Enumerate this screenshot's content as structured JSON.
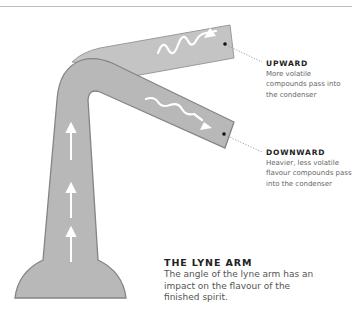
{
  "diagram": {
    "title": "THE LYNE ARM",
    "description": "The angle of the lyne arm has an impact on the flavour of the finished spirit.",
    "colors": {
      "still_fill": "#b8b8b8",
      "still_outline": "#8a8a8a",
      "arrow": "#ffffff",
      "leader_line": "#888888",
      "top_rule": "#bdbdbd"
    },
    "callouts": [
      {
        "id": "upward",
        "heading": "UPWARD",
        "text": "More volatile compounds pass into the condenser"
      },
      {
        "id": "downward",
        "heading": "DOWNWARD",
        "text": "Heavier, less volatile flavour compounds pass into the condenser"
      }
    ],
    "icons": [
      "vapour-arrow-up-icon",
      "vapour-wave-arrow-icon",
      "leader-dot-icon"
    ]
  }
}
